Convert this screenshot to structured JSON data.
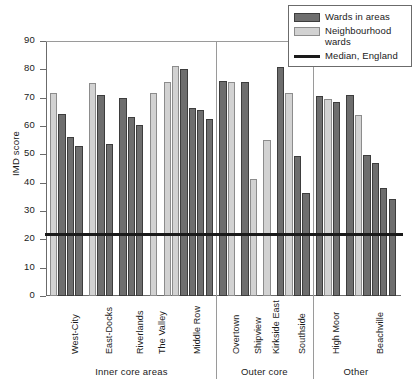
{
  "chart_data": {
    "type": "bar",
    "title": "",
    "xlabel": "",
    "ylabel": "IMD score",
    "ylim": [
      0,
      90
    ],
    "yticks": [
      0,
      10,
      20,
      30,
      40,
      50,
      60,
      70,
      80,
      90
    ],
    "grid": false,
    "legend_position": "top-right",
    "legend": [
      {
        "key": "wards_in_areas",
        "label": "Wards in areas",
        "type": "bar",
        "color": "#6e6e6e"
      },
      {
        "key": "neighbourhood_wards",
        "label": "Neighbourhood\nwards",
        "type": "bar",
        "color": "#d2d2d2"
      },
      {
        "key": "median_england",
        "label": "Median, England",
        "type": "line",
        "color": "#1a1a1a"
      }
    ],
    "legend_labels": {
      "wards_in_areas": "Wards in areas",
      "neighbourhood_wards_line1": "Neighbourhood",
      "neighbourhood_wards_line2": "wards",
      "median_england": "Median, England"
    },
    "reference_line": {
      "label": "Median, England",
      "value": 21.5
    },
    "group_headers": [
      {
        "label": "Inner core areas",
        "categories": [
          "West-City",
          "East-Docks",
          "Riverlands",
          "The Valley",
          "Middle Row"
        ]
      },
      {
        "label": "Outer core",
        "categories": [
          "Overtown",
          "Shipview",
          "Kirkside East",
          "Southside"
        ]
      },
      {
        "label": "Other",
        "categories": [
          "High Moor",
          "Beachville"
        ]
      }
    ],
    "categories": [
      "West-City",
      "East-Docks",
      "Riverlands",
      "The Valley",
      "Middle Row",
      "Overtown",
      "Shipview",
      "Kirkside East",
      "Southside",
      "High Moor",
      "Beachville"
    ],
    "groups": [
      {
        "category": "West-City",
        "bars": [
          {
            "series": "neighbourhood_wards",
            "value": 71.5
          },
          {
            "series": "wards_in_areas",
            "value": 64.2
          },
          {
            "series": "wards_in_areas",
            "value": 56.0
          },
          {
            "series": "wards_in_areas",
            "value": 52.8
          }
        ]
      },
      {
        "category": "East-Docks",
        "bars": [
          {
            "series": "neighbourhood_wards",
            "value": 75.2
          },
          {
            "series": "wards_in_areas",
            "value": 70.8
          },
          {
            "series": "wards_in_areas",
            "value": 53.8
          }
        ]
      },
      {
        "category": "Riverlands",
        "bars": [
          {
            "series": "wards_in_areas",
            "value": 69.9
          },
          {
            "series": "wards_in_areas",
            "value": 63.2
          },
          {
            "series": "wards_in_areas",
            "value": 60.4
          }
        ]
      },
      {
        "category": "The Valley",
        "bars": [
          {
            "series": "neighbourhood_wards",
            "value": 71.8
          }
        ]
      },
      {
        "category": "Middle Row",
        "bars": [
          {
            "series": "neighbourhood_wards",
            "value": 75.4
          },
          {
            "series": "neighbourhood_wards",
            "value": 81.2
          },
          {
            "series": "wards_in_areas",
            "value": 80.0
          },
          {
            "series": "wards_in_areas",
            "value": 66.5
          },
          {
            "series": "wards_in_areas",
            "value": 65.6
          },
          {
            "series": "wards_in_areas",
            "value": 62.4
          }
        ]
      },
      {
        "category": "Overtown",
        "bars": [
          {
            "series": "wards_in_areas",
            "value": 75.8
          },
          {
            "series": "neighbourhood_wards",
            "value": 75.5
          }
        ]
      },
      {
        "category": "Shipview",
        "bars": [
          {
            "series": "wards_in_areas",
            "value": 75.7
          },
          {
            "series": "neighbourhood_wards",
            "value": 41.4
          }
        ]
      },
      {
        "category": "Kirkside East",
        "bars": [
          {
            "series": "neighbourhood_wards",
            "value": 55.2
          }
        ]
      },
      {
        "category": "Southside",
        "bars": [
          {
            "series": "wards_in_areas",
            "value": 80.9
          },
          {
            "series": "neighbourhood_wards",
            "value": 71.8
          },
          {
            "series": "wards_in_areas",
            "value": 49.4
          },
          {
            "series": "wards_in_areas",
            "value": 36.4
          }
        ]
      },
      {
        "category": "High Moor",
        "bars": [
          {
            "series": "wards_in_areas",
            "value": 70.5
          },
          {
            "series": "neighbourhood_wards",
            "value": 69.4
          },
          {
            "series": "wards_in_areas",
            "value": 68.4
          }
        ]
      },
      {
        "category": "Beachville",
        "bars": [
          {
            "series": "wards_in_areas",
            "value": 71.0
          },
          {
            "series": "neighbourhood_wards",
            "value": 64.0
          },
          {
            "series": "wards_in_areas",
            "value": 49.8
          },
          {
            "series": "wards_in_areas",
            "value": 47.1
          },
          {
            "series": "wards_in_areas",
            "value": 38.2
          },
          {
            "series": "wards_in_areas",
            "value": 34.4
          }
        ]
      }
    ]
  }
}
